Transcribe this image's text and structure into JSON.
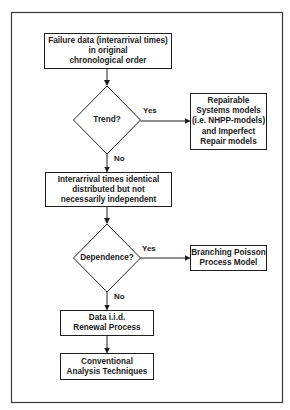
{
  "diagram": {
    "type": "flowchart",
    "colors": {
      "stroke": "#1e1e1e",
      "text": "#1a1a1a",
      "background": "#ffffff",
      "frame": "#3a3a3a"
    },
    "nodes": {
      "failure_data": {
        "shape": "rectangle",
        "text": "Failure data (interarrival times)\nin original\nchronological order"
      },
      "trend": {
        "shape": "diamond",
        "text": "Trend?"
      },
      "repairable_systems": {
        "shape": "rectangle",
        "text": "Repairable\nSystems models\n(i.e. NHPP-models)\nand Imperfect\nRepair models"
      },
      "interarrival_identical": {
        "shape": "rectangle",
        "text": "Interarrival times identical\ndistributed but not\nnecessarily independent"
      },
      "dependence": {
        "shape": "diamond",
        "text": "Dependence?"
      },
      "branching_poisson": {
        "shape": "rectangle",
        "text": "Branching Poisson\nProcess Model"
      },
      "data_iid": {
        "shape": "rectangle",
        "text": "Data i.i.d.\nRenewal Process"
      },
      "conventional": {
        "shape": "rectangle",
        "text": "Conventional\nAnalysis Techniques"
      }
    },
    "edges": {
      "e1": {
        "from": "failure_data",
        "to": "trend",
        "label": ""
      },
      "e2": {
        "from": "trend",
        "to": "repairable_systems",
        "label": "Yes"
      },
      "e3": {
        "from": "trend",
        "to": "interarrival_identical",
        "label": "No"
      },
      "e4": {
        "from": "interarrival_identical",
        "to": "dependence",
        "label": ""
      },
      "e5": {
        "from": "dependence",
        "to": "branching_poisson",
        "label": "Yes"
      },
      "e6": {
        "from": "dependence",
        "to": "data_iid",
        "label": "No"
      },
      "e7": {
        "from": "data_iid",
        "to": "conventional",
        "label": ""
      }
    }
  }
}
